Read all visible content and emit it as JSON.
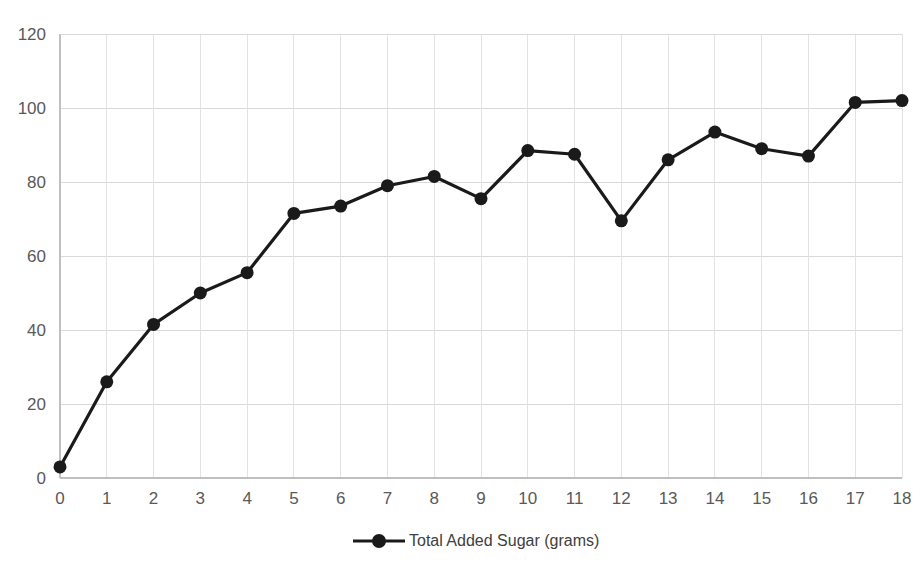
{
  "chart_data": {
    "type": "line",
    "title": "",
    "xlabel": "",
    "ylabel": "",
    "x": [
      0,
      1,
      2,
      3,
      4,
      5,
      6,
      7,
      8,
      9,
      10,
      11,
      12,
      13,
      14,
      15,
      16,
      17,
      18
    ],
    "series": [
      {
        "name": "Total Added Sugar (grams)",
        "values": [
          3,
          26,
          41.5,
          50,
          55.5,
          71.5,
          73.5,
          79,
          81.5,
          75.5,
          88.5,
          87.5,
          69.5,
          86,
          93.5,
          89,
          87,
          101.5,
          102
        ]
      }
    ],
    "x_tick_labels": [
      "0",
      "1",
      "2",
      "3",
      "4",
      "5",
      "6",
      "7",
      "8",
      "9",
      "10",
      "11",
      "12",
      "13",
      "14",
      "15",
      "16",
      "17",
      "18"
    ],
    "y_tick_labels": [
      "0",
      "20",
      "40",
      "60",
      "80",
      "100",
      "120"
    ],
    "y_ticks": [
      0,
      20,
      40,
      60,
      80,
      100,
      120
    ],
    "xlim": [
      0,
      18
    ],
    "ylim": [
      0,
      120
    ],
    "grid": {
      "horizontal": true,
      "vertical": true,
      "color": "#d9d9d9"
    },
    "legend": {
      "position": "bottom-center",
      "entries": [
        {
          "label": "Total Added Sugar (grams)",
          "color": "#1a1a1a",
          "marker": "circle",
          "line_style": "solid"
        }
      ]
    },
    "colors": {
      "series": "#1a1a1a",
      "grid": "#d9d9d9",
      "axis": "#bfbfbf",
      "tick_text": "#595959",
      "legend_text": "#404040",
      "background": "#ffffff"
    }
  }
}
